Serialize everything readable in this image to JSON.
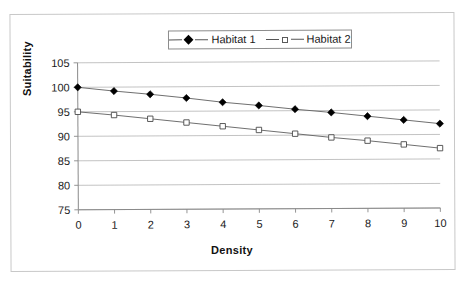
{
  "chart_data": {
    "type": "line",
    "title": "",
    "xlabel": "Density",
    "ylabel": "Suitability",
    "x": [
      0,
      1,
      2,
      3,
      4,
      5,
      6,
      7,
      8,
      9,
      10
    ],
    "xlim": [
      0,
      10
    ],
    "ylim": [
      75,
      105
    ],
    "y_ticks": [
      75,
      80,
      85,
      90,
      95,
      100,
      105
    ],
    "x_ticks": [
      0,
      1,
      2,
      3,
      4,
      5,
      6,
      7,
      8,
      9,
      10
    ],
    "grid": "horizontal",
    "legend_position": "top-center",
    "series": [
      {
        "name": "Habitat 1",
        "marker": "filled-diamond",
        "color": "#000000",
        "values": [
          100.0,
          99.2,
          98.5,
          97.7,
          96.8,
          96.1,
          95.3,
          94.6,
          93.8,
          93.0,
          92.2
        ]
      },
      {
        "name": "Habitat 2",
        "marker": "open-square",
        "color": "#ffffff",
        "values": [
          95.0,
          94.3,
          93.5,
          92.7,
          91.9,
          91.1,
          90.3,
          89.5,
          88.8,
          88.0,
          87.2
        ]
      }
    ]
  },
  "legend": {
    "entries": [
      {
        "label": "Habitat 1",
        "marker": "filled-diamond-icon"
      },
      {
        "label": "Habitat 2",
        "marker": "open-square-icon"
      }
    ]
  },
  "axes": {
    "y_title": "Suitability",
    "x_title": "Density",
    "y_tick_labels": [
      "105",
      "100",
      "95",
      "90",
      "85",
      "80",
      "75"
    ],
    "x_tick_labels": [
      "0",
      "1",
      "2",
      "3",
      "4",
      "5",
      "6",
      "7",
      "8",
      "9",
      "10"
    ]
  },
  "colors": {
    "frame": "#c8c8c8",
    "gridline": "#b4b4b4",
    "axis": "#8a8a8a",
    "series_line": "#5f5f5f",
    "text": "#1a1a1a",
    "background": "#ffffff"
  }
}
